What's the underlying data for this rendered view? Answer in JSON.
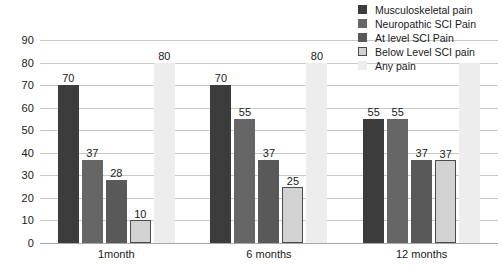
{
  "chart_data": {
    "type": "bar",
    "title": "",
    "xlabel": "",
    "ylabel": "",
    "ylim": [
      0,
      90
    ],
    "yticks": [
      0,
      10,
      20,
      30,
      40,
      50,
      60,
      70,
      80,
      90
    ],
    "grid": true,
    "legend_position": "top-right",
    "categories": [
      "1month",
      "6 months",
      "12 months"
    ],
    "series": [
      {
        "name": "Musculoskeletal pain",
        "color": "#3c3c3c",
        "values": [
          70,
          70,
          55
        ],
        "labels": [
          "70",
          "70",
          "55"
        ]
      },
      {
        "name": "Neuropathic SCI Pain",
        "color": "#666666",
        "values": [
          37,
          55,
          55
        ],
        "labels": [
          "37",
          "55",
          "55"
        ]
      },
      {
        "name": "At level SCI Pain",
        "color": "#595959",
        "values": [
          28,
          37,
          37
        ],
        "labels": [
          "28",
          "37",
          "37"
        ]
      },
      {
        "name": "Below Level SCI pain",
        "color": "#d2d2d2",
        "values": [
          10,
          25,
          37
        ],
        "labels": [
          "10",
          "25",
          "37"
        ]
      },
      {
        "name": "Any pain",
        "color": "#ededed",
        "values": [
          80,
          80,
          80
        ],
        "labels": [
          "80",
          "80",
          ""
        ]
      }
    ]
  },
  "legend": {
    "items": [
      {
        "label": "Musculoskeletal pain"
      },
      {
        "label": "Neuropathic SCI Pain"
      },
      {
        "label": "At level SCI Pain"
      },
      {
        "label": "Below Level SCI pain"
      },
      {
        "label": "Any pain"
      }
    ]
  }
}
